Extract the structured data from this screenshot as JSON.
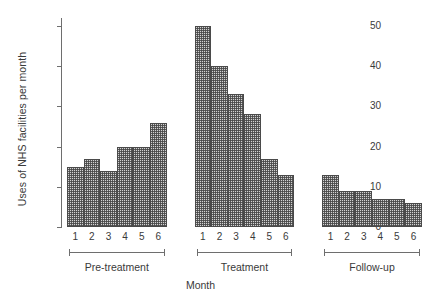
{
  "chart_data": {
    "type": "bar",
    "title": "",
    "xlabel": "Month",
    "ylabel": "Uses of NHS facilities per month",
    "ylim": [
      0,
      52
    ],
    "yticks": [
      0,
      10,
      20,
      30,
      40,
      50
    ],
    "grid": false,
    "legend": "none",
    "categories": [
      "1",
      "2",
      "3",
      "4",
      "5",
      "6"
    ],
    "groups": [
      {
        "name": "Pre-treatment",
        "categories": [
          "1",
          "2",
          "3",
          "4",
          "5",
          "6"
        ],
        "values": [
          15,
          17,
          14,
          20,
          20,
          26
        ]
      },
      {
        "name": "Treatment",
        "categories": [
          "1",
          "2",
          "3",
          "4",
          "5",
          "6"
        ],
        "values": [
          50,
          40,
          33,
          28,
          17,
          13
        ]
      },
      {
        "name": "Follow-up",
        "categories": [
          "1",
          "2",
          "3",
          "4",
          "5",
          "6"
        ],
        "values": [
          13,
          9,
          9,
          7,
          7,
          6
        ]
      }
    ],
    "colors": {
      "bar_fill": "#d2d2d2",
      "bar_edge": "#4a4a4a",
      "axis": "#6e6e6e",
      "text": "#3a3a3a",
      "background": "#ffffff"
    }
  }
}
